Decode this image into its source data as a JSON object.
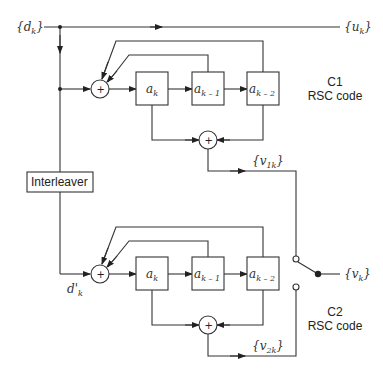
{
  "diagram": {
    "type": "turbo-encoder-block-diagram",
    "input": {
      "label": "{d",
      "sub": "k",
      "close": "}"
    },
    "systematic_output": {
      "label": "{u",
      "sub": "k",
      "close": "}"
    },
    "interleaver": {
      "label": "Interleaver"
    },
    "interleaved_input": {
      "label": "d'",
      "sub": "k"
    },
    "encoder1": {
      "name": "C1",
      "type": "RSC code",
      "registers": [
        {
          "label": "a",
          "sub": "k"
        },
        {
          "label": "a",
          "sub": "k – 1"
        },
        {
          "label": "a",
          "sub": "k – 2"
        }
      ],
      "adder_symbol": "+",
      "output": {
        "label": "{v",
        "sub": "1k",
        "close": "}"
      }
    },
    "encoder2": {
      "name": "C2",
      "type": "RSC code",
      "registers": [
        {
          "label": "a",
          "sub": "k"
        },
        {
          "label": "a",
          "sub": "k – 1"
        },
        {
          "label": "a",
          "sub": "k – 2"
        }
      ],
      "adder_symbol": "+",
      "output": {
        "label": "{v",
        "sub": "2k",
        "close": "}"
      }
    },
    "switch_output": {
      "label": "{v",
      "sub": "k",
      "close": "}"
    }
  }
}
